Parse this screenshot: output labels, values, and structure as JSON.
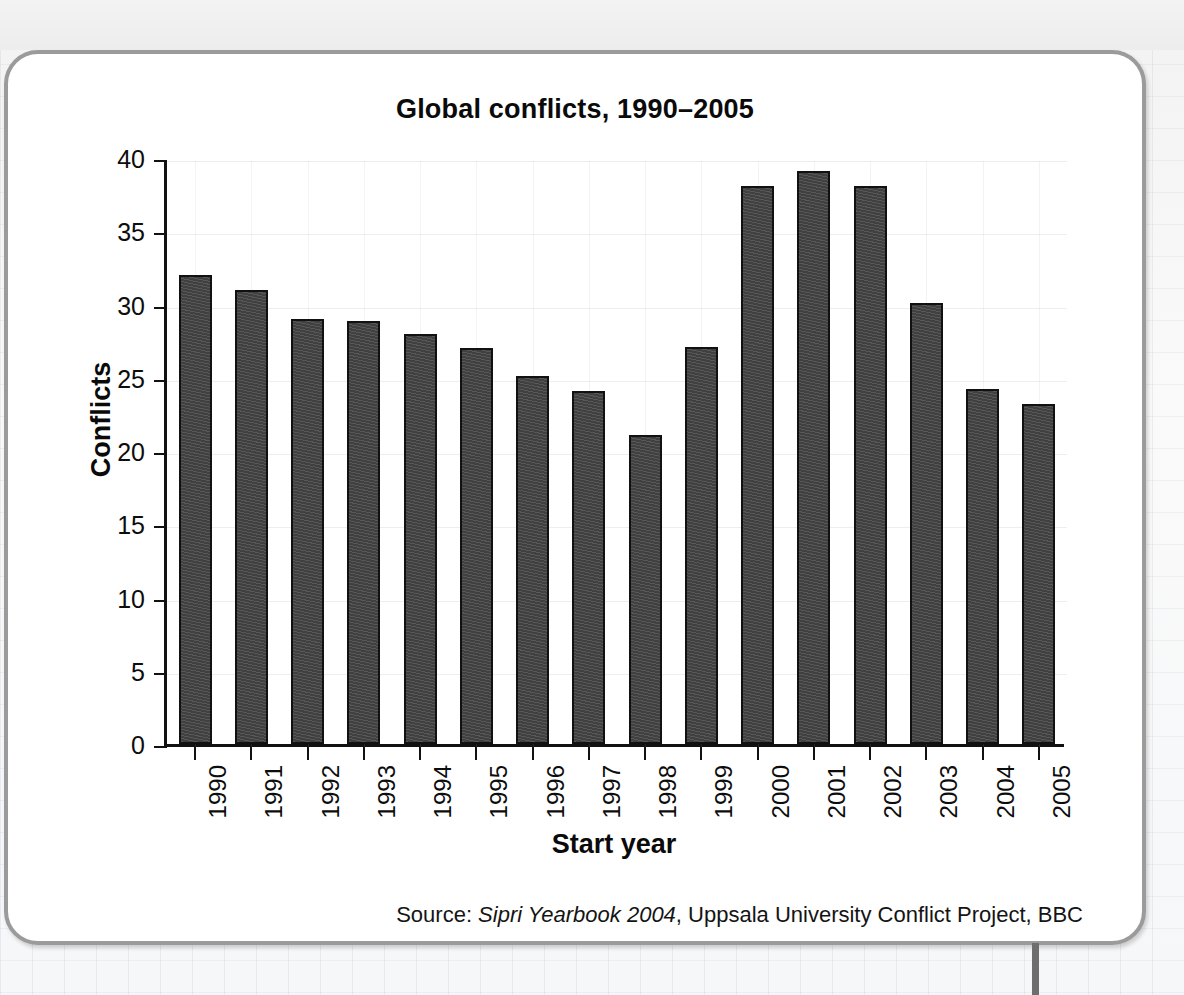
{
  "chart_data": {
    "type": "bar",
    "title": "Global conflicts, 1990–2005",
    "xlabel": "Start year",
    "ylabel": "Conflicts",
    "categories": [
      "1990",
      "1991",
      "1992",
      "1993",
      "1994",
      "1995",
      "1996",
      "1997",
      "1998",
      "1999",
      "2000",
      "2001",
      "2002",
      "2003",
      "2004",
      "2005"
    ],
    "values": [
      32,
      31,
      29,
      28.9,
      28,
      27,
      25.1,
      24.1,
      21.1,
      27.1,
      38.1,
      39.1,
      38.1,
      30.1,
      24.2,
      23.2
    ],
    "ylim": [
      0,
      40
    ],
    "yticks": [
      0,
      5,
      10,
      15,
      20,
      25,
      30,
      35,
      40
    ],
    "ytick_labels": [
      "0",
      "5",
      "10",
      "15",
      "20",
      "25",
      "30",
      "35",
      "40"
    ],
    "grid": true,
    "legend": false,
    "bar_color": "#434343",
    "bar_edge_color": "#111111"
  },
  "source_note": {
    "prefix": "Source: ",
    "italic": "Sipri Yearbook 2004",
    "suffix": ", Uppsala University Conflict Project, BBC"
  },
  "colors": {
    "card_border": "#9b9b9b",
    "axis": "#111111",
    "text": "#0a0a0a",
    "background": "#ffffff"
  }
}
